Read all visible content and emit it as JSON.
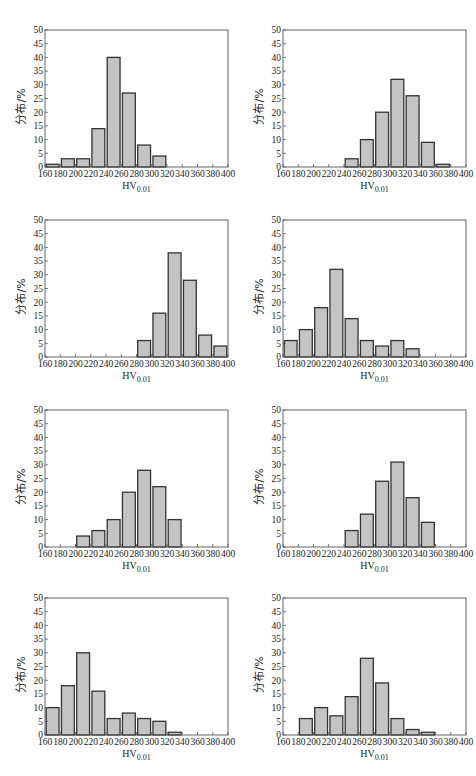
{
  "figure": {
    "ylabel": "分布/%",
    "xlabel_main": "HV",
    "xlabel_sub": "0.01",
    "bar_fill": "#c4c4c4",
    "bar_stroke": "#333333",
    "axis_color": "#555555"
  },
  "chart_data": [
    {
      "type": "bar",
      "panel": "(a)",
      "title": "",
      "xlabel": "HV0.01",
      "ylabel": "分布/%",
      "xlim": [
        160,
        400
      ],
      "ylim": [
        0,
        50
      ],
      "xticks": [
        160,
        180,
        200,
        220,
        240,
        260,
        280,
        300,
        320,
        340,
        360,
        380,
        400
      ],
      "yticks": [
        0,
        5,
        10,
        15,
        20,
        25,
        30,
        35,
        40,
        45,
        50
      ],
      "bins": [
        [
          160,
          180
        ],
        [
          180,
          200
        ],
        [
          200,
          220
        ],
        [
          220,
          240
        ],
        [
          240,
          260
        ],
        [
          260,
          280
        ],
        [
          280,
          300
        ],
        [
          300,
          320
        ]
      ],
      "values": [
        1,
        3,
        3,
        14,
        40,
        27,
        8,
        4
      ]
    },
    {
      "type": "bar",
      "panel": "(b)",
      "title": "",
      "xlabel": "HV0.01",
      "ylabel": "分布/%",
      "xlim": [
        160,
        400
      ],
      "ylim": [
        0,
        50
      ],
      "xticks": [
        160,
        180,
        200,
        220,
        240,
        260,
        280,
        300,
        320,
        340,
        360,
        380,
        400
      ],
      "yticks": [
        0,
        5,
        10,
        15,
        20,
        25,
        30,
        35,
        40,
        45,
        50
      ],
      "bins": [
        [
          240,
          260
        ],
        [
          260,
          280
        ],
        [
          280,
          300
        ],
        [
          300,
          320
        ],
        [
          320,
          340
        ],
        [
          340,
          360
        ],
        [
          360,
          380
        ]
      ],
      "values": [
        3,
        10,
        20,
        32,
        26,
        9,
        1
      ]
    },
    {
      "type": "bar",
      "panel": "(c)",
      "title": "",
      "xlabel": "HV0.01",
      "ylabel": "分布/%",
      "xlim": [
        160,
        400
      ],
      "ylim": [
        0,
        50
      ],
      "xticks": [
        160,
        180,
        200,
        220,
        240,
        260,
        280,
        300,
        320,
        340,
        360,
        380,
        400
      ],
      "yticks": [
        0,
        5,
        10,
        15,
        20,
        25,
        30,
        35,
        40,
        45,
        50
      ],
      "bins": [
        [
          280,
          300
        ],
        [
          300,
          320
        ],
        [
          320,
          340
        ],
        [
          340,
          360
        ],
        [
          360,
          380
        ],
        [
          380,
          400
        ]
      ],
      "values": [
        6,
        16,
        38,
        28,
        8,
        4
      ]
    },
    {
      "type": "bar",
      "panel": "(d)",
      "title": "",
      "xlabel": "HV0.01",
      "ylabel": "分布/%",
      "xlim": [
        160,
        400
      ],
      "ylim": [
        0,
        50
      ],
      "xticks": [
        160,
        180,
        200,
        220,
        240,
        260,
        280,
        300,
        320,
        340,
        360,
        380,
        400
      ],
      "yticks": [
        0,
        5,
        10,
        15,
        20,
        25,
        30,
        35,
        40,
        45,
        50
      ],
      "bins": [
        [
          160,
          180
        ],
        [
          180,
          200
        ],
        [
          200,
          220
        ],
        [
          220,
          240
        ],
        [
          240,
          260
        ],
        [
          260,
          280
        ],
        [
          280,
          300
        ],
        [
          300,
          320
        ],
        [
          320,
          340
        ]
      ],
      "values": [
        6,
        10,
        18,
        32,
        14,
        6,
        4,
        6,
        3
      ]
    },
    {
      "type": "bar",
      "panel": "(e)",
      "title": "",
      "xlabel": "HV0.01",
      "ylabel": "分布/%",
      "xlim": [
        160,
        400
      ],
      "ylim": [
        0,
        50
      ],
      "xticks": [
        160,
        180,
        200,
        220,
        240,
        260,
        280,
        300,
        320,
        340,
        360,
        380,
        400
      ],
      "yticks": [
        0,
        5,
        10,
        15,
        20,
        25,
        30,
        35,
        40,
        45,
        50
      ],
      "bins": [
        [
          200,
          220
        ],
        [
          220,
          240
        ],
        [
          240,
          260
        ],
        [
          260,
          280
        ],
        [
          280,
          300
        ],
        [
          300,
          320
        ],
        [
          320,
          340
        ]
      ],
      "values": [
        4,
        6,
        10,
        20,
        28,
        22,
        10
      ]
    },
    {
      "type": "bar",
      "panel": "(f)",
      "title": "",
      "xlabel": "HV0.01",
      "ylabel": "分布/%",
      "xlim": [
        160,
        400
      ],
      "ylim": [
        0,
        50
      ],
      "xticks": [
        160,
        180,
        200,
        220,
        240,
        260,
        280,
        300,
        320,
        340,
        360,
        380,
        400
      ],
      "yticks": [
        0,
        5,
        10,
        15,
        20,
        25,
        30,
        35,
        40,
        45,
        50
      ],
      "bins": [
        [
          240,
          260
        ],
        [
          260,
          280
        ],
        [
          280,
          300
        ],
        [
          300,
          320
        ],
        [
          320,
          340
        ],
        [
          340,
          360
        ]
      ],
      "values": [
        6,
        12,
        24,
        31,
        18,
        9
      ]
    },
    {
      "type": "bar",
      "panel": "(g)",
      "title": "",
      "xlabel": "HV0.01",
      "ylabel": "分布/%",
      "xlim": [
        160,
        400
      ],
      "ylim": [
        0,
        50
      ],
      "xticks": [
        160,
        180,
        200,
        220,
        240,
        260,
        280,
        300,
        320,
        340,
        360,
        380,
        400
      ],
      "yticks": [
        0,
        5,
        10,
        15,
        20,
        25,
        30,
        35,
        40,
        45,
        50
      ],
      "bins": [
        [
          160,
          180
        ],
        [
          180,
          200
        ],
        [
          200,
          220
        ],
        [
          220,
          240
        ],
        [
          240,
          260
        ],
        [
          260,
          280
        ],
        [
          280,
          300
        ],
        [
          300,
          320
        ],
        [
          320,
          340
        ]
      ],
      "values": [
        10,
        18,
        30,
        16,
        6,
        8,
        6,
        5,
        1
      ]
    },
    {
      "type": "bar",
      "panel": "(h)",
      "title": "",
      "xlabel": "HV0.01",
      "ylabel": "分布/%",
      "xlim": [
        160,
        400
      ],
      "ylim": [
        0,
        50
      ],
      "xticks": [
        160,
        180,
        200,
        220,
        240,
        260,
        280,
        300,
        320,
        340,
        360,
        380,
        400
      ],
      "yticks": [
        0,
        5,
        10,
        15,
        20,
        25,
        30,
        35,
        40,
        45,
        50
      ],
      "bins": [
        [
          180,
          200
        ],
        [
          200,
          220
        ],
        [
          220,
          240
        ],
        [
          240,
          260
        ],
        [
          260,
          280
        ],
        [
          280,
          300
        ],
        [
          300,
          320
        ],
        [
          320,
          340
        ],
        [
          340,
          360
        ]
      ],
      "values": [
        6,
        10,
        7,
        14,
        28,
        19,
        6,
        2,
        1
      ]
    }
  ],
  "layout": {
    "panels": [
      {
        "left": 0,
        "top": 0
      },
      {
        "left": 238,
        "top": 0
      },
      {
        "left": 0,
        "top": 190
      },
      {
        "left": 238,
        "top": 190
      },
      {
        "left": 0,
        "top": 380
      },
      {
        "left": 238,
        "top": 380
      },
      {
        "left": 0,
        "top": 568
      },
      {
        "left": 238,
        "top": 568
      }
    ]
  }
}
